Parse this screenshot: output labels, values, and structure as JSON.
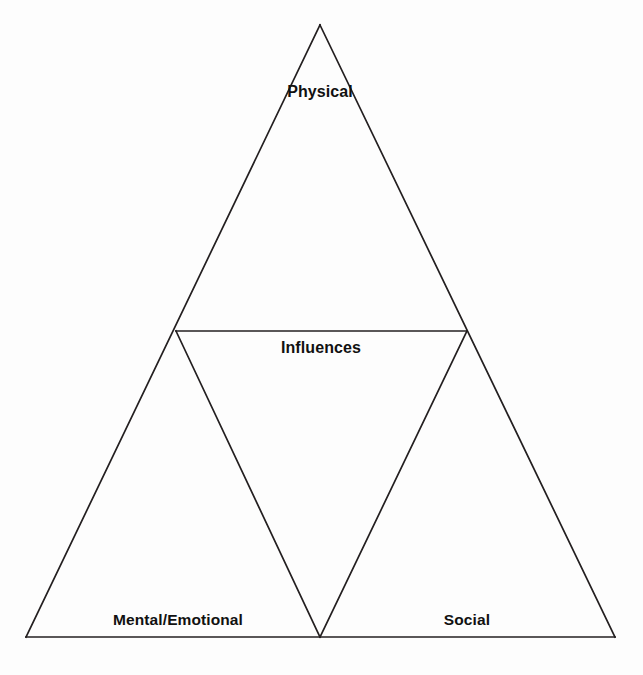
{
  "diagram": {
    "type": "triangle-diagram",
    "background_color": "#fdfdfd",
    "line_color": "#231f20",
    "text_color": "#111111",
    "outer_triangle": {
      "name": "outer-triangle",
      "apex": {
        "x": 320,
        "y": 25
      },
      "bottom_left": {
        "x": 26,
        "y": 637
      },
      "bottom_right": {
        "x": 615,
        "y": 637
      }
    },
    "inner_triangle": {
      "name": "inner-inverted-triangle",
      "left_midpoint": {
        "x": 176,
        "y": 331
      },
      "right_midpoint": {
        "x": 467,
        "y": 331
      },
      "bottom_midpoint": {
        "x": 320,
        "y": 637
      }
    },
    "labels": {
      "apex": "Physical",
      "center": "Influences",
      "bottom_left": "Mental/Emotional",
      "bottom_right": "Social"
    }
  }
}
